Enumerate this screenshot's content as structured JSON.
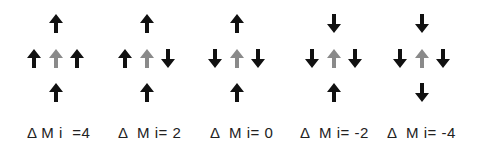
{
  "colors": {
    "spin_other": "#111111",
    "spin_center": "#8a8a8a",
    "label": "#222222"
  },
  "diagrams": [
    {
      "label": "Δ M i  =4",
      "delta_mi": 4,
      "top": "up",
      "left": "up",
      "center": "up",
      "right": "up",
      "bottom": "up"
    },
    {
      "label": "Δ  M i= 2",
      "delta_mi": 2,
      "top": "up",
      "left": "up",
      "center": "up",
      "right": "down",
      "bottom": "up"
    },
    {
      "label": "Δ  M i= 0",
      "delta_mi": 0,
      "top": "up",
      "left": "down",
      "center": "up",
      "right": "down",
      "bottom": "up"
    },
    {
      "label": "Δ  M i= -2",
      "delta_mi": -2,
      "top": "down",
      "left": "down",
      "center": "up",
      "right": "down",
      "bottom": "up"
    },
    {
      "label": "Δ  M i= -4",
      "delta_mi": -4,
      "top": "down",
      "left": "down",
      "center": "up",
      "right": "down",
      "bottom": "down"
    }
  ]
}
